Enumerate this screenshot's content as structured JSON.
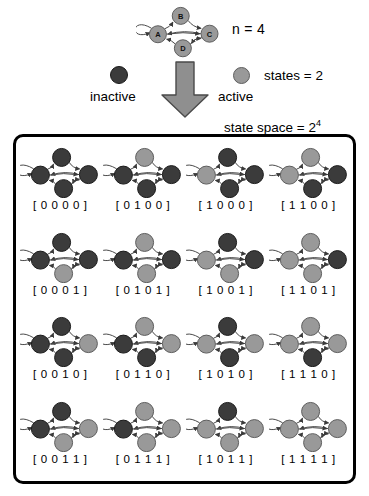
{
  "legend": {
    "n_label": "n = 4",
    "states_label": "states = 2",
    "state_space_label": "state space = 2",
    "state_space_exponent": "4",
    "inactive_label": "inactive",
    "active_label": "active",
    "inactive_color": "#3b3b3b",
    "active_color": "#999999",
    "arrow_color": "#8a8a8a",
    "border_color": "#000000"
  },
  "master_network": {
    "nodes": [
      {
        "id": "A",
        "label": "A",
        "x": 20,
        "y": 30
      },
      {
        "id": "B",
        "label": "B",
        "x": 45,
        "y": 12
      },
      {
        "id": "C",
        "label": "C",
        "x": 72,
        "y": 29
      },
      {
        "id": "D",
        "label": "D",
        "x": 46,
        "y": 45
      }
    ],
    "edges": [
      "A->A",
      "A->B",
      "B->C",
      "C->A",
      "A->C",
      "D->A",
      "C->D",
      "D->C"
    ]
  },
  "grid": {
    "cells": [
      {
        "label": "[ 0 0 0 0 ]",
        "states": [
          0,
          0,
          0,
          0
        ]
      },
      {
        "label": "[ 0 1 0 0 ]",
        "states": [
          0,
          1,
          0,
          0
        ]
      },
      {
        "label": "[ 1 0 0 0 ]",
        "states": [
          1,
          0,
          0,
          0
        ]
      },
      {
        "label": "[ 1 1 0 0 ]",
        "states": [
          1,
          1,
          0,
          0
        ]
      },
      {
        "label": "[ 0 0 0 1 ]",
        "states": [
          0,
          0,
          0,
          1
        ]
      },
      {
        "label": "[ 0 1 0 1 ]",
        "states": [
          0,
          1,
          0,
          1
        ]
      },
      {
        "label": "[ 1 0 0 1 ]",
        "states": [
          1,
          0,
          0,
          1
        ]
      },
      {
        "label": "[ 1 1 0 1 ]",
        "states": [
          1,
          1,
          0,
          1
        ]
      },
      {
        "label": "[ 0 0 1 0 ]",
        "states": [
          0,
          0,
          1,
          0
        ]
      },
      {
        "label": "[ 0 1 1 0 ]",
        "states": [
          0,
          1,
          1,
          0
        ]
      },
      {
        "label": "[ 1 0 1 0 ]",
        "states": [
          1,
          0,
          1,
          0
        ]
      },
      {
        "label": "[ 1 1 1 0 ]",
        "states": [
          1,
          1,
          1,
          0
        ]
      },
      {
        "label": "[ 0 0 1 1 ]",
        "states": [
          0,
          0,
          1,
          1
        ]
      },
      {
        "label": "[ 0 1 1 1 ]",
        "states": [
          0,
          1,
          1,
          1
        ]
      },
      {
        "label": "[ 1 0 1 1 ]",
        "states": [
          1,
          0,
          1,
          1
        ]
      },
      {
        "label": "[ 1 1 1 1 ]",
        "states": [
          1,
          1,
          1,
          1
        ]
      }
    ]
  }
}
